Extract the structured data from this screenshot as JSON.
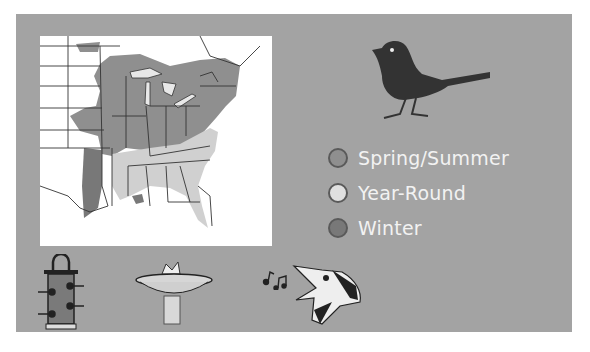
{
  "legend": {
    "items": [
      {
        "label": "Spring/Summer",
        "color": "#8f8f8f"
      },
      {
        "label": "Year-Round",
        "color": "#e0e0e0"
      },
      {
        "label": "Winter",
        "color": "#787878"
      }
    ]
  },
  "colors": {
    "background": "#a3a3a3",
    "map_background": "#ffffff",
    "spring_summer": "#8f8f8f",
    "year_round": "#d0d0d0",
    "winter": "#787878",
    "legend_text": "#f2f2f2"
  },
  "icons": {
    "bird_silhouette": "bird-silhouette-icon",
    "feeder": "tube-feeder-icon",
    "birdbath": "birdbath-icon",
    "singing_bird": "singing-bird-icon",
    "music_notes": "music-notes-icon"
  }
}
